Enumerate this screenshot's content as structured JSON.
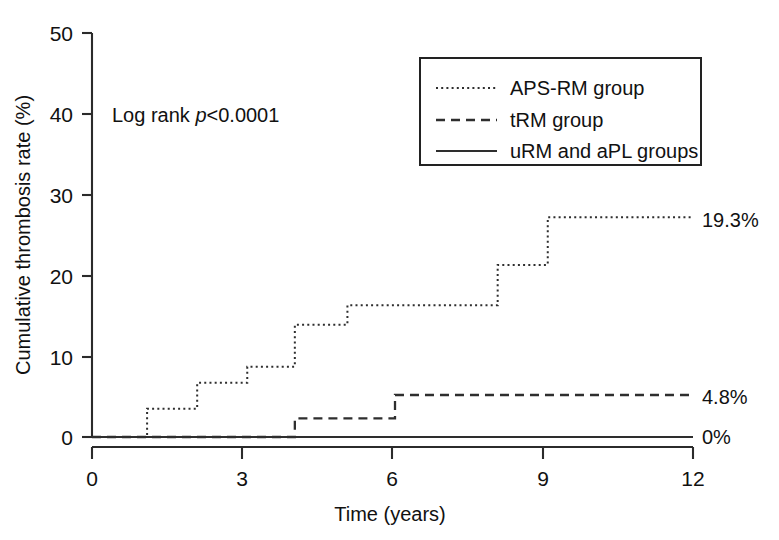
{
  "chart_data": {
    "type": "line",
    "subtype": "kaplan-meier-step",
    "title": "",
    "xlabel": "Time (years)",
    "ylabel": "Cumulative thrombosis rate (%)",
    "xlim": [
      0,
      12
    ],
    "ylim": [
      0,
      50
    ],
    "xticks": [
      0,
      3,
      6,
      9,
      12
    ],
    "xtick_labels": [
      "0",
      "3",
      "6",
      "9",
      "12"
    ],
    "yticks": [
      0,
      10,
      20,
      30,
      40,
      50
    ],
    "ytick_labels": [
      "0",
      "10",
      "20",
      "30",
      "40",
      "50"
    ],
    "grid": false,
    "legend_position": "top-right",
    "annotations": [
      {
        "name": "log-rank-annotation",
        "text_prefix": "Log rank ",
        "text_italic": "p",
        "text_suffix": "<0.0001",
        "x": 1.1,
        "y": 40
      }
    ],
    "series": [
      {
        "name": "APS-RM group",
        "style": "dotted",
        "end_label": "19.3%",
        "steps": [
          {
            "x": 0.0,
            "y": 0.0
          },
          {
            "x": 1.1,
            "y": 3.5
          },
          {
            "x": 2.1,
            "y": 6.7
          },
          {
            "x": 3.1,
            "y": 8.7
          },
          {
            "x": 4.05,
            "y": 13.9
          },
          {
            "x": 5.1,
            "y": 16.3
          },
          {
            "x": 8.1,
            "y": 21.3
          },
          {
            "x": 9.1,
            "y": 27.2
          },
          {
            "x": 12.0,
            "y": 27.2
          }
        ]
      },
      {
        "name": "tRM group",
        "style": "dashed",
        "end_label": "4.8%",
        "steps": [
          {
            "x": 0.0,
            "y": 0.0
          },
          {
            "x": 4.05,
            "y": 2.3
          },
          {
            "x": 6.05,
            "y": 5.2
          },
          {
            "x": 12.0,
            "y": 5.2
          }
        ]
      },
      {
        "name": "uRM and aPL groups",
        "style": "solid",
        "end_label": "0%",
        "steps": [
          {
            "x": 0.0,
            "y": 0.0
          },
          {
            "x": 12.0,
            "y": 0.0
          }
        ]
      }
    ]
  },
  "legend": {
    "entries": [
      {
        "label": "APS-RM group",
        "style": "dotted"
      },
      {
        "label": "tRM group",
        "style": "dashed"
      },
      {
        "label": "uRM and aPL groups",
        "style": "solid"
      }
    ]
  },
  "axes": {
    "x_title": "Time (years)",
    "y_title": "Cumulative thrombosis rate (%)",
    "x_tick_labels": [
      "0",
      "3",
      "6",
      "9",
      "12"
    ],
    "y_tick_labels": [
      "0",
      "10",
      "20",
      "30",
      "40",
      "50"
    ]
  },
  "end_labels": {
    "aps_rm": "19.3%",
    "trm": "4.8%",
    "urm_apl": "0%"
  },
  "stats": {
    "log_rank_prefix": "Log rank ",
    "log_rank_italic": "p",
    "log_rank_suffix": "<0.0001"
  },
  "colors": {
    "ink": "#2b2b2b",
    "background": "#ffffff"
  }
}
